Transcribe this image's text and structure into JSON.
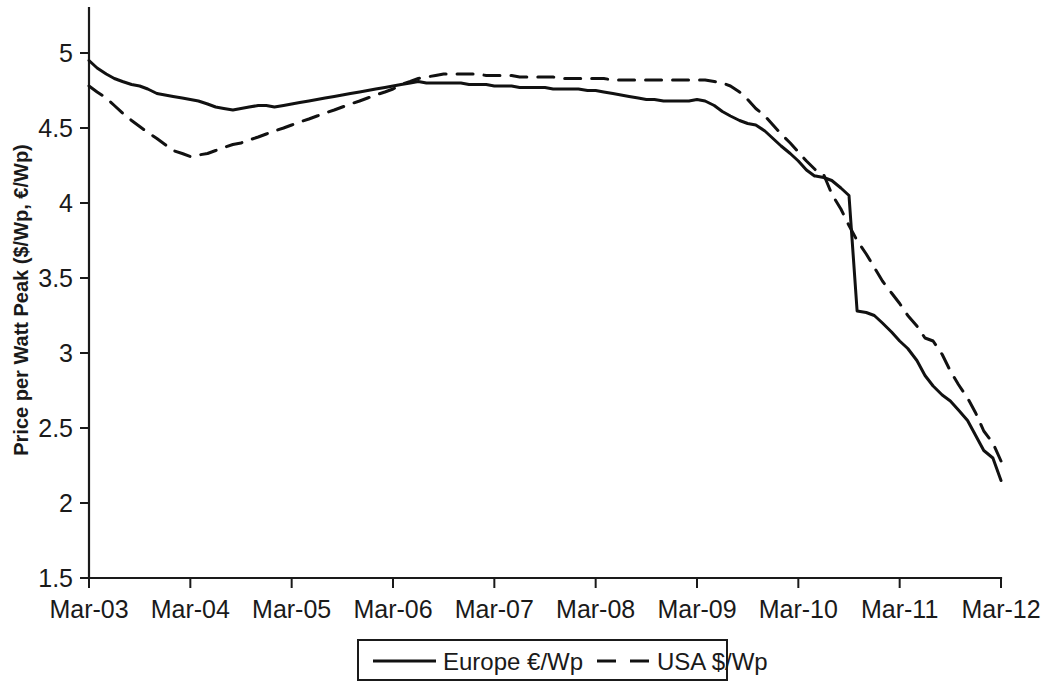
{
  "chart_data": {
    "type": "line",
    "title": "",
    "xlabel": "",
    "ylabel": "Price per Watt Peak ($/Wp, €/Wp)",
    "ylim": [
      1.5,
      5.0
    ],
    "ytick_labels": [
      "1.5",
      "2",
      "2.5",
      "3",
      "3.5",
      "4",
      "4.5",
      "5"
    ],
    "ytick_values": [
      1.5,
      2.0,
      2.5,
      3.0,
      3.5,
      4.0,
      4.5,
      5.0
    ],
    "xtick_labels": [
      "Mar-03",
      "Mar-04",
      "Mar-05",
      "Mar-06",
      "Mar-07",
      "Mar-08",
      "Mar-09",
      "Mar-10",
      "Mar-11",
      "Mar-12"
    ],
    "xtick_values": [
      2003.0,
      2004.0,
      2005.0,
      2006.0,
      2007.0,
      2008.0,
      2009.0,
      2010.0,
      2011.0,
      2012.0
    ],
    "xlim": [
      2003.0,
      2012.0
    ],
    "grid": false,
    "legend_position": "bottom-center",
    "series": [
      {
        "name": "Europe €/Wp",
        "style": "solid",
        "color": "#111111",
        "x": [
          2003.0,
          2003.08,
          2003.17,
          2003.25,
          2003.33,
          2003.42,
          2003.5,
          2003.58,
          2003.67,
          2003.75,
          2003.83,
          2003.92,
          2004.0,
          2004.08,
          2004.17,
          2004.25,
          2004.33,
          2004.42,
          2004.5,
          2004.58,
          2004.67,
          2004.75,
          2004.83,
          2004.92,
          2005.0,
          2005.08,
          2005.17,
          2005.25,
          2005.33,
          2005.42,
          2005.5,
          2005.58,
          2005.67,
          2005.75,
          2005.83,
          2005.92,
          2006.0,
          2006.08,
          2006.17,
          2006.25,
          2006.33,
          2006.42,
          2006.5,
          2006.58,
          2006.67,
          2006.75,
          2006.83,
          2006.92,
          2007.0,
          2007.08,
          2007.17,
          2007.25,
          2007.33,
          2007.42,
          2007.5,
          2007.58,
          2007.67,
          2007.75,
          2007.83,
          2007.92,
          2008.0,
          2008.08,
          2008.17,
          2008.25,
          2008.33,
          2008.42,
          2008.5,
          2008.58,
          2008.67,
          2008.75,
          2008.83,
          2008.92,
          2009.0,
          2009.08,
          2009.17,
          2009.25,
          2009.33,
          2009.42,
          2009.5,
          2009.58,
          2009.67,
          2009.75,
          2009.83,
          2009.92,
          2010.0,
          2010.08,
          2010.16,
          2010.17,
          2010.25,
          2010.33,
          2010.42,
          2010.5,
          2010.58,
          2010.67,
          2010.75,
          2010.83,
          2010.92,
          2011.0,
          2011.08,
          2011.17,
          2011.25,
          2011.33,
          2011.42,
          2011.5,
          2011.58,
          2011.67,
          2011.75,
          2011.83,
          2011.92,
          2012.0
        ],
        "y": [
          4.95,
          4.9,
          4.86,
          4.83,
          4.81,
          4.79,
          4.78,
          4.76,
          4.73,
          4.72,
          4.71,
          4.7,
          4.69,
          4.68,
          4.66,
          4.64,
          4.63,
          4.62,
          4.63,
          4.64,
          4.65,
          4.65,
          4.64,
          4.65,
          4.66,
          4.67,
          4.68,
          4.69,
          4.7,
          4.71,
          4.72,
          4.73,
          4.74,
          4.75,
          4.76,
          4.77,
          4.78,
          4.79,
          4.8,
          4.81,
          4.8,
          4.8,
          4.8,
          4.8,
          4.8,
          4.79,
          4.79,
          4.79,
          4.78,
          4.78,
          4.78,
          4.77,
          4.77,
          4.77,
          4.77,
          4.76,
          4.76,
          4.76,
          4.76,
          4.75,
          4.75,
          4.74,
          4.73,
          4.72,
          4.71,
          4.7,
          4.69,
          4.69,
          4.68,
          4.68,
          4.68,
          4.68,
          4.69,
          4.68,
          4.65,
          4.61,
          4.58,
          4.55,
          4.53,
          4.52,
          4.48,
          4.43,
          4.38,
          4.33,
          4.28,
          4.22,
          4.18,
          4.18,
          4.17,
          4.15,
          4.1,
          4.05,
          3.28,
          3.27,
          3.25,
          3.2,
          3.14,
          3.08,
          3.03,
          2.95,
          2.85,
          2.78,
          2.72,
          2.68,
          2.62,
          2.55,
          2.45,
          2.35,
          2.3,
          2.15
        ]
      },
      {
        "name": "USA $/Wp",
        "style": "dashed",
        "color": "#111111",
        "x": [
          2003.0,
          2003.08,
          2003.17,
          2003.25,
          2003.33,
          2003.42,
          2003.5,
          2003.58,
          2003.67,
          2003.75,
          2003.83,
          2003.92,
          2004.0,
          2004.08,
          2004.17,
          2004.25,
          2004.33,
          2004.42,
          2004.5,
          2004.58,
          2004.67,
          2004.75,
          2004.83,
          2004.92,
          2005.0,
          2005.08,
          2005.17,
          2005.25,
          2005.33,
          2005.42,
          2005.5,
          2005.58,
          2005.67,
          2005.75,
          2005.83,
          2005.92,
          2006.0,
          2006.08,
          2006.17,
          2006.25,
          2006.33,
          2006.42,
          2006.5,
          2006.58,
          2006.67,
          2006.75,
          2006.83,
          2006.92,
          2007.0,
          2007.08,
          2007.17,
          2007.25,
          2007.33,
          2007.42,
          2007.5,
          2007.58,
          2007.67,
          2007.75,
          2007.83,
          2007.92,
          2008.0,
          2008.08,
          2008.17,
          2008.25,
          2008.33,
          2008.42,
          2008.5,
          2008.58,
          2008.67,
          2008.75,
          2008.83,
          2008.92,
          2009.0,
          2009.08,
          2009.17,
          2009.25,
          2009.33,
          2009.42,
          2009.5,
          2009.58,
          2009.67,
          2009.75,
          2009.83,
          2009.92,
          2010.0,
          2010.08,
          2010.17,
          2010.25,
          2010.33,
          2010.42,
          2010.5,
          2010.58,
          2010.67,
          2010.75,
          2010.83,
          2010.92,
          2011.0,
          2011.08,
          2011.17,
          2011.25,
          2011.33,
          2011.42,
          2011.5,
          2011.58,
          2011.67,
          2011.75,
          2011.83,
          2011.92,
          2012.0
        ],
        "y": [
          4.78,
          4.74,
          4.7,
          4.65,
          4.6,
          4.55,
          4.51,
          4.47,
          4.43,
          4.39,
          4.35,
          4.33,
          4.31,
          4.32,
          4.33,
          4.35,
          4.37,
          4.39,
          4.4,
          4.42,
          4.44,
          4.46,
          4.48,
          4.5,
          4.52,
          4.54,
          4.56,
          4.58,
          4.6,
          4.62,
          4.64,
          4.66,
          4.68,
          4.7,
          4.72,
          4.74,
          4.76,
          4.79,
          4.81,
          4.83,
          4.84,
          4.85,
          4.86,
          4.86,
          4.86,
          4.86,
          4.86,
          4.85,
          4.85,
          4.85,
          4.85,
          4.84,
          4.84,
          4.84,
          4.84,
          4.84,
          4.83,
          4.83,
          4.83,
          4.83,
          4.83,
          4.83,
          4.82,
          4.82,
          4.82,
          4.82,
          4.82,
          4.82,
          4.82,
          4.82,
          4.82,
          4.82,
          4.82,
          4.82,
          4.81,
          4.8,
          4.78,
          4.74,
          4.69,
          4.63,
          4.58,
          4.52,
          4.46,
          4.4,
          4.34,
          4.28,
          4.22,
          4.19,
          4.06,
          3.96,
          3.85,
          3.75,
          3.66,
          3.57,
          3.48,
          3.4,
          3.33,
          3.25,
          3.18,
          3.1,
          3.08,
          2.99,
          2.88,
          2.79,
          2.7,
          2.6,
          2.48,
          2.4,
          2.28
        ]
      }
    ]
  },
  "legend": {
    "items": [
      {
        "label": "Europe €/Wp",
        "style": "solid"
      },
      {
        "label": "USA $/Wp",
        "style": "dashed"
      }
    ]
  }
}
